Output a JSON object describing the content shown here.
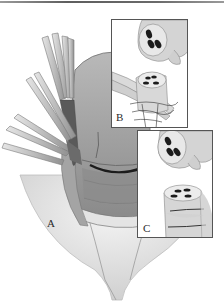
{
  "figure": {
    "panels": [
      {
        "id": "A",
        "label": "A"
      },
      {
        "id": "B",
        "label": "B"
      },
      {
        "id": "C",
        "label": "C"
      }
    ]
  },
  "colors": {
    "background": "#ffffff",
    "tissue_light": "#d8d8d8",
    "tissue_mid": "#a8a8a8",
    "tissue_dark": "#5a5a5a",
    "lumen": "#1c1c1c",
    "border": "#555555"
  }
}
